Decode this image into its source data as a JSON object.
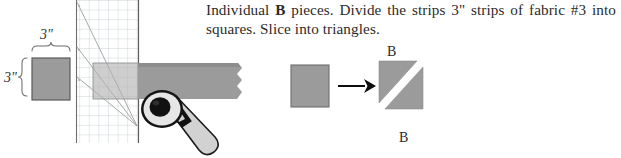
{
  "page": {
    "width": 621,
    "height": 158,
    "background": "#ffffff"
  },
  "instruction": {
    "line_before_bold": "Individual ",
    "bold_token": "B",
    "line_after_bold": " pieces. Divide the strips 3\" strips of fabric #3 into squares. Slice into triangles.",
    "full_text": "Individual B pieces. Divide the strips 3\" strips of fabric #3 into squares. Slice into triangles."
  },
  "left_diagram": {
    "name": "three-inch-square-with-dimensions",
    "top_dimension_label": "3\"",
    "left_dimension_label": "3\"",
    "square": {
      "fill": "#9b9b9b",
      "stroke": "#5a5a5a",
      "x": 32,
      "y": 58,
      "width": 38,
      "height": 42
    },
    "brace_color": "#6d6d6d"
  },
  "cutting_mat": {
    "name": "rotary-cutting-mat",
    "grid_color": "#b9c3c9",
    "grid_spacing": 9.6,
    "ruler_line_color": "#6f6f6f",
    "angle_line_color": "#9a9a9a",
    "angle_lines_count": 3,
    "angle_tick_labels": [
      "",
      "",
      ""
    ],
    "converge_point": {
      "x": 137,
      "y": 126
    },
    "fabric_strip": {
      "fill_light": "#b0b0b0",
      "fill_dark": "#9b9b9b",
      "x": 93,
      "y": 63,
      "width": 148,
      "height": 35
    },
    "rotary_cutter": {
      "blade_outer": "#1a1a1a",
      "blade_ring": "#e8e8e8",
      "blade_hub": "#111111",
      "handle_fill": "#d2d2d2",
      "handle_stroke": "#1a1a1a",
      "center": {
        "x": 163,
        "y": 108
      }
    }
  },
  "right_diagram": {
    "name": "square-to-triangles",
    "source_square": {
      "fill": "#9b9b9b",
      "stroke": "#6d6d6d",
      "x": 291,
      "y": 65,
      "width": 38,
      "height": 42
    },
    "arrow": {
      "color": "#0d0d0d",
      "from_x": 338,
      "to_x": 372,
      "y": 86
    },
    "triangles": [
      {
        "label": "B",
        "position": "upper-left",
        "fill": "#9b9b9b"
      },
      {
        "label": "B",
        "position": "lower-right",
        "fill": "#9b9b9b"
      }
    ],
    "label_top": "B",
    "label_bottom": "B",
    "bounds": {
      "x": 379,
      "y": 60,
      "width": 48,
      "height": 68
    }
  },
  "colors": {
    "fabric_gray": "#9b9b9b",
    "fabric_gray_light": "#b0b0b0",
    "outline_gray": "#5a5a5a",
    "grid_blue_gray": "#b9c3c9",
    "text": "#2b2b2b",
    "arrow_black": "#0d0d0d"
  }
}
